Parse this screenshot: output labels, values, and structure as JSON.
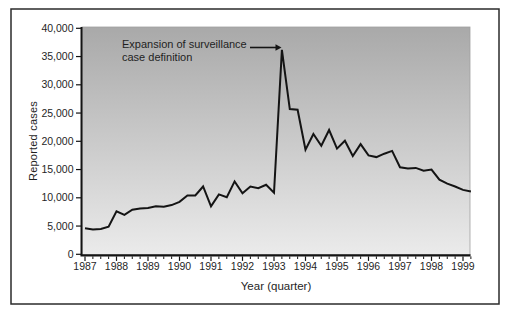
{
  "figure": {
    "ylabel": "Reported cases",
    "xlabel": "Year (quarter)",
    "annotation_line1": "Expansion of surveillance",
    "annotation_line2": "case definition"
  },
  "chart_data": {
    "type": "line",
    "title": "",
    "xlabel": "Year (quarter)",
    "ylabel": "Reported cases",
    "ylim": [
      0,
      40000
    ],
    "ytick_step": 5000,
    "ytick_labels": [
      "0",
      "5,000",
      "10,000",
      "15,000",
      "20,000",
      "25,000",
      "30,000",
      "35,000",
      "40,000"
    ],
    "x_years": [
      "1987",
      "1988",
      "1989",
      "1990",
      "1991",
      "1992",
      "1993",
      "1994",
      "1995",
      "1996",
      "1997",
      "1998",
      "1999"
    ],
    "grid": false,
    "legend": "none",
    "annotation": {
      "text": "Expansion of surveillance case definition",
      "points_to": "1993 spike peak (~36,000 cases)"
    },
    "x_quarters": [
      "1987 Q1",
      "1987 Q2",
      "1987 Q3",
      "1987 Q4",
      "1988 Q1",
      "1988 Q2",
      "1988 Q3",
      "1988 Q4",
      "1989 Q1",
      "1989 Q2",
      "1989 Q3",
      "1989 Q4",
      "1990 Q1",
      "1990 Q2",
      "1990 Q3",
      "1990 Q4",
      "1991 Q1",
      "1991 Q2",
      "1991 Q3",
      "1991 Q4",
      "1992 Q1",
      "1992 Q2",
      "1992 Q3",
      "1992 Q4",
      "1993 Q1",
      "1993 Q2",
      "1993 Q3",
      "1993 Q4",
      "1994 Q1",
      "1994 Q2",
      "1994 Q3",
      "1994 Q4",
      "1995 Q1",
      "1995 Q2",
      "1995 Q3",
      "1995 Q4",
      "1996 Q1",
      "1996 Q2",
      "1996 Q3",
      "1996 Q4",
      "1997 Q1",
      "1997 Q2",
      "1997 Q3",
      "1997 Q4",
      "1998 Q1",
      "1998 Q2",
      "1998 Q3",
      "1998 Q4",
      "1999 Q1",
      "1999 Q2"
    ],
    "series": [
      {
        "name": "Reported cases",
        "values": [
          4600,
          4400,
          4500,
          4900,
          7600,
          7000,
          7900,
          8100,
          8200,
          8500,
          8400,
          8700,
          9300,
          10400,
          10400,
          12000,
          8500,
          10600,
          10100,
          12900,
          10800,
          12000,
          11700,
          12300,
          10900,
          36200,
          25700,
          25600,
          18500,
          21300,
          19200,
          22000,
          18700,
          20100,
          17400,
          19500,
          17500,
          17200,
          17800,
          18300,
          15400,
          15200,
          15300,
          14800,
          15000,
          13200,
          12500,
          12000,
          11400,
          11100
        ]
      }
    ],
    "colors": {
      "line": "#141414",
      "plot_bg_top": "#a9a9a9",
      "plot_bg_bottom": "#ebebeb",
      "plot_border": "#a0a0a0",
      "frame": "#2b2b2b",
      "text": "#1f1f1f"
    }
  }
}
